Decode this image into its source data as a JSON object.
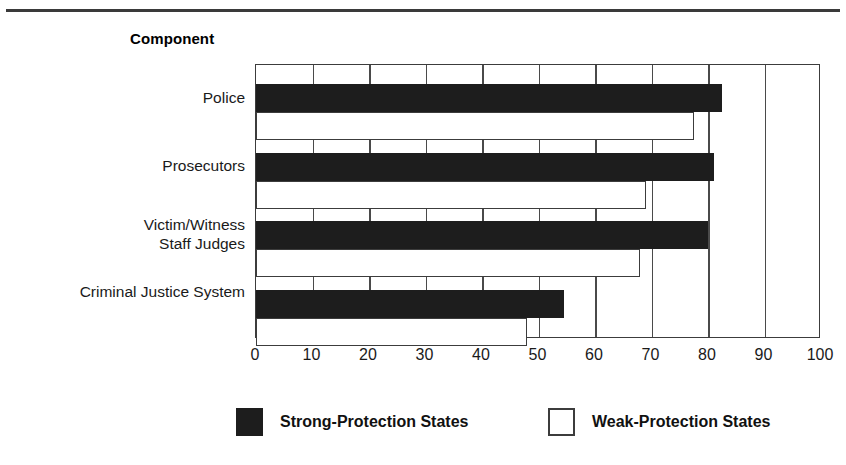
{
  "chart_data": {
    "type": "bar",
    "orientation": "horizontal",
    "title": "",
    "axis_group_label": "Component",
    "xlabel": "",
    "ylabel": "Component",
    "xlim": [
      0,
      100
    ],
    "xticks": [
      0,
      10,
      20,
      30,
      40,
      50,
      60,
      70,
      80,
      90,
      100
    ],
    "xtick_labels": [
      "0",
      "10",
      "20",
      "30",
      "40",
      "50",
      "60",
      "70",
      "80",
      "90",
      "100"
    ],
    "grid": true,
    "grid_axis": "x",
    "legend_position": "bottom",
    "categories": [
      "Police",
      "Prosecutors",
      "Victim/Witness\nStaff Judges",
      "Criminal Justice System"
    ],
    "series": [
      {
        "name": "Strong-Protection States",
        "color": "#1d1d1d",
        "values": [
          82.5,
          81,
          80,
          54.5
        ]
      },
      {
        "name": "Weak-Protection States",
        "color": "#ffffff",
        "values": [
          77.5,
          69,
          68,
          48
        ]
      }
    ]
  },
  "figure": {
    "axis_title": "Component",
    "categories": [
      {
        "label": "Police",
        "lines": [
          "Police"
        ]
      },
      {
        "label": "Prosecutors",
        "lines": [
          "Prosecutors"
        ]
      },
      {
        "label": "Victim/Witness Staff Judges",
        "lines": [
          "Victim/Witness",
          "Staff Judges"
        ]
      },
      {
        "label": "Criminal Justice System",
        "lines": [
          "Criminal Justice System"
        ]
      }
    ],
    "xticks": [
      "0",
      "10",
      "20",
      "30",
      "40",
      "50",
      "60",
      "70",
      "80",
      "90",
      "100"
    ],
    "legend": [
      {
        "label": "Strong-Protection States",
        "swatch": "filled"
      },
      {
        "label": "Weak-Protection States",
        "swatch": "hollow"
      }
    ]
  }
}
